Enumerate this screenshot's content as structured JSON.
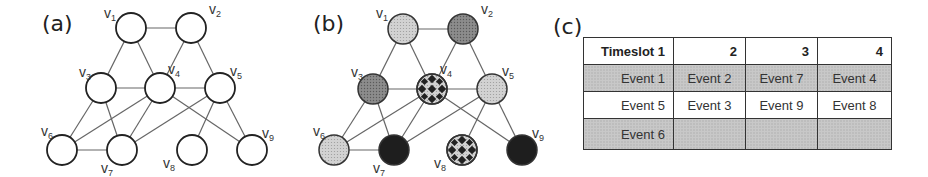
{
  "panels": {
    "a": {
      "label": "(a)"
    },
    "b": {
      "label": "(b)"
    },
    "c": {
      "label": "(c)"
    }
  },
  "graph": {
    "node_labels": [
      "v1",
      "v2",
      "v3",
      "v4",
      "v5",
      "v6",
      "v7",
      "v8",
      "v9"
    ],
    "edges": [
      [
        "v1",
        "v2"
      ],
      [
        "v1",
        "v3"
      ],
      [
        "v1",
        "v4"
      ],
      [
        "v2",
        "v4"
      ],
      [
        "v2",
        "v5"
      ],
      [
        "v3",
        "v4"
      ],
      [
        "v4",
        "v5"
      ],
      [
        "v3",
        "v6"
      ],
      [
        "v3",
        "v7"
      ],
      [
        "v4",
        "v6"
      ],
      [
        "v4",
        "v7"
      ],
      [
        "v4",
        "v9"
      ],
      [
        "v5",
        "v7"
      ],
      [
        "v5",
        "v8"
      ],
      [
        "v5",
        "v9"
      ],
      [
        "v6",
        "v7"
      ]
    ],
    "coloring_b": {
      "v1": "light",
      "v2": "dark",
      "v3": "dark",
      "v4": "checker",
      "v5": "light",
      "v6": "light",
      "v7": "black",
      "v8": "checker",
      "v9": "black"
    },
    "colors": {
      "light": "#c9c9c9",
      "dark": "#8a8a8a",
      "black": "#1e1e1e",
      "checker": "#d0d0d0",
      "stroke": "#333333",
      "edge": "#666666"
    }
  },
  "table": {
    "header": [
      "Timeslot 1",
      "2",
      "3",
      "4"
    ],
    "rows": [
      [
        "Event 1",
        "Event 2",
        "Event 7",
        "Event 4"
      ],
      [
        "Event 5",
        "Event 3",
        "Event 9",
        "Event 8"
      ],
      [
        "Event 6",
        "",
        "",
        ""
      ]
    ]
  }
}
